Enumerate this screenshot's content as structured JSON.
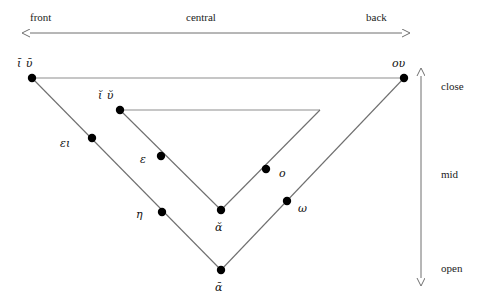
{
  "figure": {
    "type": "vowel-quadrilateral-diagram"
  },
  "horizontal_axis": {
    "name": "backness-axis",
    "labels": {
      "left": "front",
      "center": "central",
      "right": "back"
    },
    "arrow": "double-headed-horizontal"
  },
  "vertical_axis": {
    "name": "height-axis",
    "labels": {
      "top": "close",
      "middle": "mid",
      "bottom": "open"
    },
    "arrow": "double-headed-vertical"
  },
  "colors": {
    "line": "#6f6f6f",
    "dot": "#000000",
    "text": "#1a1a1a",
    "background": "#ffffff"
  },
  "outer_triangle": {
    "name": "long-vowel-triangle",
    "vertices": [
      {
        "id": "outer-top-left",
        "x": 32,
        "y": 78
      },
      {
        "id": "outer-top-right",
        "x": 404,
        "y": 78
      },
      {
        "id": "outer-bottom",
        "x": 221,
        "y": 270
      }
    ]
  },
  "inner_triangle": {
    "name": "short-vowel-triangle",
    "vertices": [
      {
        "id": "inner-top-left",
        "x": 120,
        "y": 110
      },
      {
        "id": "inner-top-right",
        "x": 320,
        "y": 110
      },
      {
        "id": "inner-bottom",
        "x": 221,
        "y": 210
      }
    ]
  },
  "points": [
    {
      "id": "i-long-u-long",
      "label": "ῑ  ῡ",
      "x": 32,
      "y": 78,
      "label_x": 17,
      "label_y": 58,
      "dot": true
    },
    {
      "id": "ou",
      "label": "ου",
      "x": 404,
      "y": 78,
      "label_x": 392,
      "label_y": 58,
      "dot": true
    },
    {
      "id": "i-short-u-short",
      "label": "ῐ  ῠ",
      "x": 120,
      "y": 110,
      "label_x": 98,
      "label_y": 90,
      "dot": true
    },
    {
      "id": "ei",
      "label": "ει",
      "x": 92,
      "y": 138,
      "label_x": 60,
      "label_y": 138,
      "dot": true
    },
    {
      "id": "epsilon",
      "label": "ε",
      "x": 161,
      "y": 156,
      "label_x": 140,
      "label_y": 154,
      "dot": true
    },
    {
      "id": "eta",
      "label": "η",
      "x": 162,
      "y": 212,
      "label_x": 136,
      "label_y": 209,
      "dot": true
    },
    {
      "id": "omicron",
      "label": "ο",
      "x": 266,
      "y": 169,
      "label_x": 279,
      "label_y": 168,
      "dot": true
    },
    {
      "id": "omega",
      "label": "ω",
      "x": 287,
      "y": 201,
      "label_x": 298,
      "label_y": 203,
      "dot": true
    },
    {
      "id": "a-short",
      "label": "ᾰ",
      "x": 221,
      "y": 210,
      "label_x": 215,
      "label_y": 222,
      "dot": true
    },
    {
      "id": "a-long",
      "label": "ᾱ",
      "x": 221,
      "y": 270,
      "label_x": 215,
      "label_y": 282,
      "dot": true
    }
  ],
  "axis_label_positions": {
    "front": {
      "x": 30,
      "y": 12
    },
    "central": {
      "x": 186,
      "y": 12
    },
    "back": {
      "x": 366,
      "y": 12
    },
    "close": {
      "x": 441,
      "y": 81
    },
    "mid": {
      "x": 441,
      "y": 169
    },
    "open": {
      "x": 441,
      "y": 263
    }
  }
}
